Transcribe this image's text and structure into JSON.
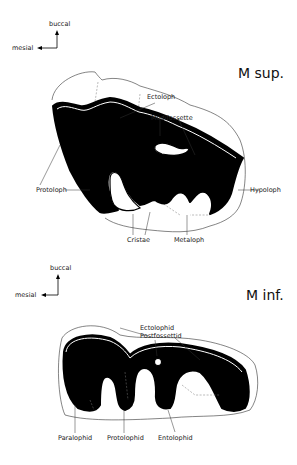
{
  "upper": {
    "title": "M sup.",
    "orientation": {
      "vertical": "buccal",
      "horizontal": "mesial"
    },
    "labels": {
      "ectoloph": "Ectoloph",
      "medifossette": "Medifossette",
      "protoloph": "Protoloph",
      "hypoloph": "Hypoloph",
      "cristae": "Cristae",
      "metaloph": "Metaloph"
    }
  },
  "lower": {
    "title": "M inf.",
    "orientation": {
      "vertical": "buccal",
      "horizontal": "mesial"
    },
    "labels": {
      "ectolophid": "Ectolophid",
      "postfossettid": "Postfossettid",
      "paralophid": "Paralophid",
      "protolophid": "Protolophid",
      "entolophid": "Entolophid"
    }
  },
  "colors": {
    "enamel": "#000000",
    "background": "#ffffff",
    "line": "#333333"
  }
}
